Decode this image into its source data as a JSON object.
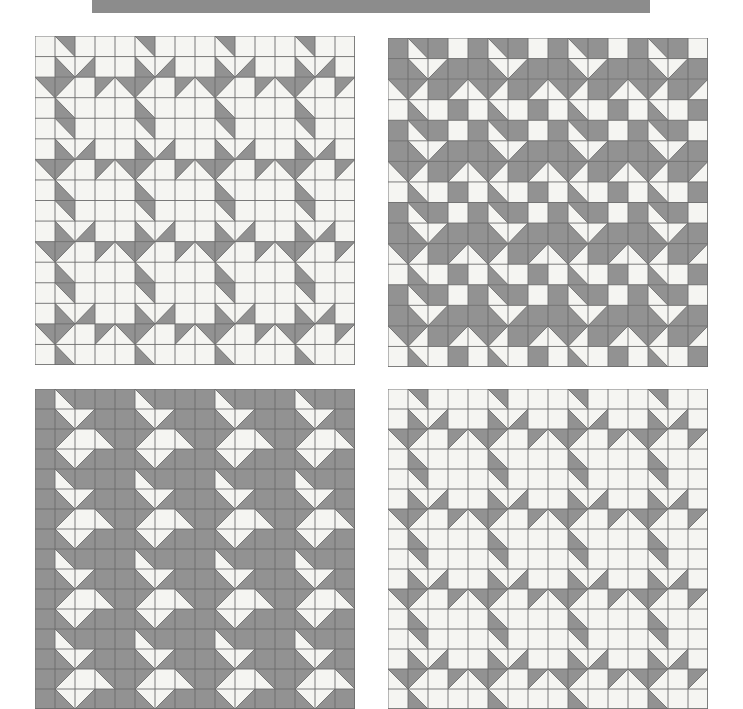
{
  "page": {
    "background_color": "#ffffff",
    "width": 743,
    "height": 709
  },
  "header_bar": {
    "name": "top-gray-banner",
    "color": "#8c8c8c",
    "x": 92,
    "y": 0,
    "width": 558,
    "height": 13
  },
  "palette": {
    "light": "#f5f5f2",
    "dark": "#929292",
    "grid_line": "#6b6b6b",
    "banner": "#8c8c8c",
    "page_background": "#ffffff"
  },
  "legend": {
    "cell_codes": {
      "L": "light solid square",
      "D": "dark solid square",
      "1": "half-square triangle, dark in top-left corner",
      "2": "half-square triangle, dark in top-right corner",
      "3": "half-square triangle, dark in bottom-right corner",
      "4": "half-square triangle, dark in bottom-left corner"
    }
  },
  "chart_data": {
    "type": "table",
    "grid_columns": 16,
    "grid_rows": 16,
    "cell_size": 20,
    "quilts": [
      {
        "name": "quilt-top-left",
        "position": "top-left",
        "x": 35,
        "y": 36,
        "width": 320,
        "height": 329,
        "rows": [
          "L2LLL2LLL2LLL2LL",
          "L43LL43LL43LL43L",
          "21L121L121L121L1",
          "L4LLL4LLL4LLL4LL",
          "L2LLL2LLL2LLL2LL",
          "L43LL43LL43LL43L",
          "21L121L121L121L1",
          "L4LLL4LLL4LLL4LL",
          "L2LLL2LLL2LLL2LL",
          "L43LL43LL43LL43L",
          "21L121L121L121L1",
          "L4LLL4LLL4LLL4LL",
          "L2LLL2LLL2LLL2LL",
          "L43LL43LL43LL43L",
          "21L121L121L121L1",
          "L4LLL4LLL4LLL4LL"
        ]
      },
      {
        "name": "quilt-top-right",
        "position": "top-right",
        "x": 388,
        "y": 38,
        "width": 320,
        "height": 329,
        "rows": [
          "D2DLD2DLD2DLD2DL",
          "D43DD43DD43DD43D",
          "21D121D121D121D1",
          "L4LDL4LDL4LDL4LD",
          "D2DLD2DLD2DLD2DL",
          "D43DD43DD43DD43D",
          "21D121D121D121D1",
          "L4LDL4LDL4LDL4LD",
          "D2DLD2DLD2DLD2DL",
          "D43DD43DD43DD43D",
          "21D121D121D121D1",
          "L4LDL4LDL4LDL4LD",
          "D2DLD2DLD2DLD2DL",
          "D43DD43DD43DD43D",
          "21D121D121D121D1",
          "L4LDL4LDL4LDL4LD"
        ]
      },
      {
        "name": "quilt-bottom-left",
        "position": "bottom-left",
        "x": 35,
        "y": 389,
        "width": 320,
        "height": 320,
        "rows": [
          "D2DDD2DDD2DDD2DD",
          "D43DD43DD43DD43D",
          "D1L2D1L2D1L2D1L2",
          "D43DD43DD43DD43D",
          "D2DDD2DDD2DDD2DD",
          "D43DD43DD43DD43D",
          "D1L2D1L2D1L2D1L2",
          "D43DD43DD43DD43D",
          "D2DDD2DDD2DDD2DD",
          "D43DD43DD43DD43D",
          "D1L2D1L2D1L2D1L2",
          "D43DD43DD43DD43D",
          "D2DDD2DDD2DDD2DD",
          "D43DD43DD43DD43D",
          "D1L2D1L2D1L2D1L2",
          "D43DD43DD43DD43D"
        ]
      },
      {
        "name": "quilt-bottom-right",
        "position": "bottom-right",
        "x": 388,
        "y": 389,
        "width": 320,
        "height": 320,
        "rows": [
          "L2LLL2LLL2LLL2LL",
          "L43LL43LL43LL43L",
          "21L121L121L121L1",
          "L4LLL4LLL4LLL4LL",
          "L2LLL2LLL2LLL2LL",
          "L43LL43LL43LL43L",
          "21L121L121L121L1",
          "L4LLL4LLL4LLL4LL",
          "L2LLL2LLL2LLL2LL",
          "L43LL43LL43LL43L",
          "21L121L121L121L1",
          "L4LLL4LLL4LLL4LL",
          "L2LLL2LLL2LLL2LL",
          "L43LL43LL43LL43L",
          "21L121L121L121L1",
          "L4LLL4LLL4LLL4LL"
        ]
      }
    ]
  }
}
